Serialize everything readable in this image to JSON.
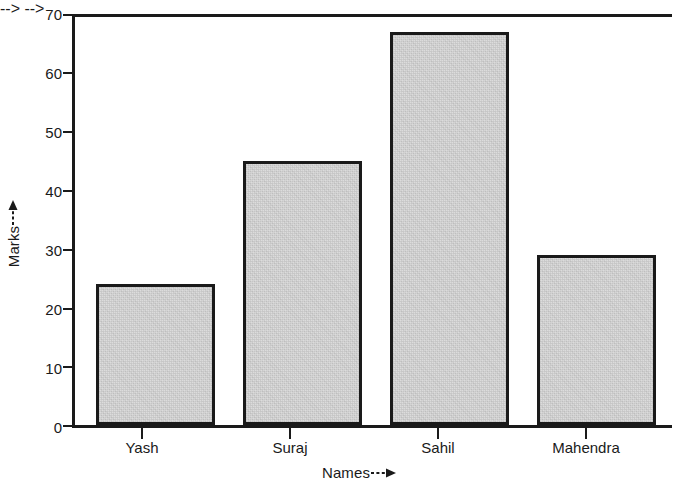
{
  "chart_data": {
    "type": "bar",
    "title": "",
    "subtitle": "",
    "categories": [
      "Yash",
      "Suraj",
      "Sahil",
      "Mahendra"
    ],
    "values": [
      24,
      45,
      67,
      29
    ],
    "xlabel": "Names",
    "ylabel": "Marks",
    "xlabel_arrow": "--->",
    "ylabel_arrow": "--->",
    "ylim": [
      0,
      70
    ],
    "yticks": [
      0,
      10,
      20,
      30,
      40,
      50,
      60,
      70
    ],
    "ytick_labels": [
      "0",
      "10",
      "20",
      "30",
      "40",
      "50",
      "60",
      "70"
    ],
    "grid": false,
    "legend": false,
    "legend_position": "none",
    "bar_fill_color": "#dcdcdc",
    "bar_edge_color": "#1a1a1a",
    "axis_color": "#1a1a1a",
    "background_color": "#ffffff"
  }
}
